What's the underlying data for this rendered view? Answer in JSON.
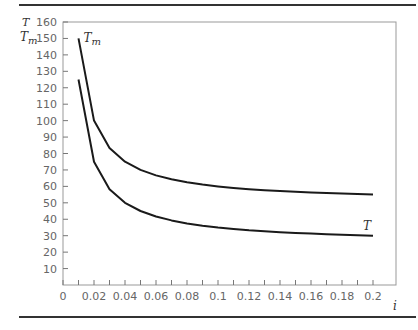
{
  "chart_data": {
    "type": "line",
    "title": "",
    "xlabel": "i",
    "ylabel": "T, T_m",
    "ylabel_lines": [
      "T",
      "T_m"
    ],
    "xlim": [
      0,
      0.2
    ],
    "ylim": [
      0,
      160
    ],
    "grid": false,
    "x_ticks": [
      "0",
      "0.02",
      "0.04",
      "0.06",
      "0.08",
      "0.1",
      "0.12",
      "0.14",
      "0.16",
      "0.18",
      "0.2"
    ],
    "y_ticks": [
      "10",
      "20",
      "30",
      "40",
      "50",
      "60",
      "70",
      "80",
      "90",
      "100",
      "110",
      "120",
      "130",
      "140",
      "150",
      "160"
    ],
    "x": [
      0.01,
      0.02,
      0.03,
      0.04,
      0.05,
      0.06,
      0.07,
      0.08,
      0.09,
      0.1,
      0.11,
      0.12,
      0.13,
      0.14,
      0.15,
      0.16,
      0.17,
      0.18,
      0.19,
      0.2
    ],
    "series": [
      {
        "name": "T_m",
        "label": "T",
        "subscript": "m",
        "values": [
          150,
          100,
          83.3,
          75,
          70,
          66.7,
          64.3,
          62.5,
          61.1,
          60,
          59.1,
          58.3,
          57.7,
          57.1,
          56.7,
          56.3,
          55.9,
          55.6,
          55.3,
          55
        ]
      },
      {
        "name": "T",
        "label": "T",
        "subscript": "",
        "values": [
          125,
          75,
          58.3,
          50,
          45,
          41.7,
          39.3,
          37.5,
          36.1,
          35,
          34.1,
          33.3,
          32.7,
          32.1,
          31.7,
          31.3,
          30.9,
          30.6,
          30.3,
          30
        ]
      }
    ]
  }
}
